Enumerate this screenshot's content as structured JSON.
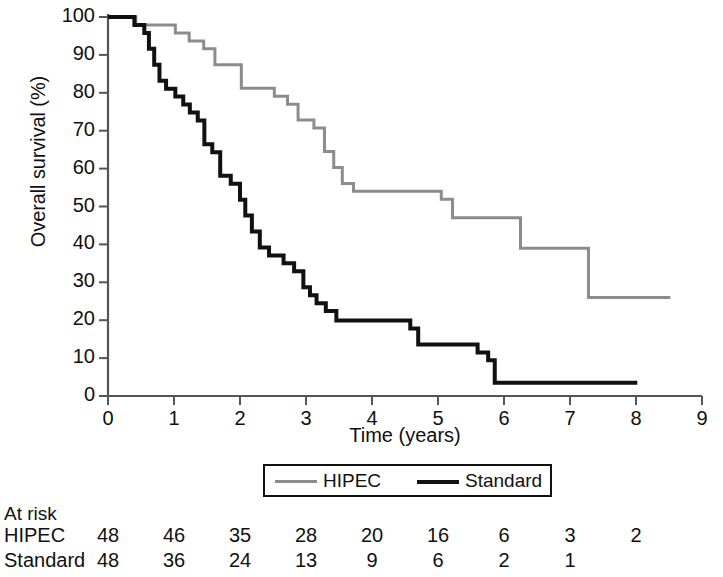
{
  "chart_data": {
    "type": "line",
    "title": "",
    "subtitle": "",
    "xlabel": "Time (years)",
    "ylabel": "Overall survival (%)",
    "xlim": [
      0,
      9
    ],
    "ylim": [
      0,
      100
    ],
    "xticks": [
      0,
      1,
      2,
      3,
      4,
      5,
      6,
      7,
      8,
      9
    ],
    "yticks": [
      0,
      10,
      20,
      30,
      40,
      50,
      60,
      70,
      80,
      90,
      100
    ],
    "grid": false,
    "legend_position": "bottom-center",
    "curve_style": "kaplan-meier step",
    "series": [
      {
        "name": "HIPEC",
        "color": "#8c8c8c",
        "linewidth": 3,
        "points": [
          [
            0.0,
            100
          ],
          [
            0.42,
            100
          ],
          [
            0.42,
            97.9
          ],
          [
            1.02,
            97.9
          ],
          [
            1.02,
            95.8
          ],
          [
            1.23,
            95.8
          ],
          [
            1.23,
            93.7
          ],
          [
            1.45,
            93.7
          ],
          [
            1.45,
            91.6
          ],
          [
            1.62,
            91.6
          ],
          [
            1.62,
            87.4
          ],
          [
            2.02,
            87.4
          ],
          [
            2.02,
            81.2
          ],
          [
            2.52,
            81.2
          ],
          [
            2.52,
            79.1
          ],
          [
            2.72,
            79.1
          ],
          [
            2.72,
            77.0
          ],
          [
            2.88,
            77.0
          ],
          [
            2.88,
            72.8
          ],
          [
            3.12,
            72.8
          ],
          [
            3.12,
            70.7
          ],
          [
            3.28,
            70.7
          ],
          [
            3.28,
            64.5
          ],
          [
            3.42,
            64.5
          ],
          [
            3.42,
            60.3
          ],
          [
            3.55,
            60.3
          ],
          [
            3.55,
            56.1
          ],
          [
            3.72,
            56.1
          ],
          [
            3.72,
            54.0
          ],
          [
            5.05,
            54.0
          ],
          [
            5.05,
            51.9
          ],
          [
            5.22,
            51.9
          ],
          [
            5.22,
            47.0
          ],
          [
            6.25,
            47.0
          ],
          [
            6.25,
            39.0
          ],
          [
            7.28,
            39.0
          ],
          [
            7.28,
            26.0
          ],
          [
            8.52,
            26.0
          ]
        ]
      },
      {
        "name": "Standard",
        "color": "#111111",
        "linewidth": 4,
        "points": [
          [
            0.0,
            100
          ],
          [
            0.4,
            100
          ],
          [
            0.4,
            97.9
          ],
          [
            0.55,
            97.9
          ],
          [
            0.55,
            95.8
          ],
          [
            0.62,
            95.8
          ],
          [
            0.62,
            91.6
          ],
          [
            0.7,
            91.6
          ],
          [
            0.7,
            87.4
          ],
          [
            0.78,
            87.4
          ],
          [
            0.78,
            83.2
          ],
          [
            0.88,
            83.2
          ],
          [
            0.88,
            81.1
          ],
          [
            1.02,
            81.1
          ],
          [
            1.02,
            79.0
          ],
          [
            1.14,
            79.0
          ],
          [
            1.14,
            76.9
          ],
          [
            1.24,
            76.9
          ],
          [
            1.24,
            74.8
          ],
          [
            1.36,
            74.8
          ],
          [
            1.36,
            72.7
          ],
          [
            1.46,
            72.7
          ],
          [
            1.46,
            66.4
          ],
          [
            1.58,
            66.4
          ],
          [
            1.58,
            64.3
          ],
          [
            1.7,
            64.3
          ],
          [
            1.7,
            58.1
          ],
          [
            1.86,
            58.1
          ],
          [
            1.86,
            56.0
          ],
          [
            2.0,
            56.0
          ],
          [
            2.0,
            51.8
          ],
          [
            2.08,
            51.8
          ],
          [
            2.08,
            47.6
          ],
          [
            2.18,
            47.6
          ],
          [
            2.18,
            43.4
          ],
          [
            2.3,
            43.4
          ],
          [
            2.3,
            39.2
          ],
          [
            2.44,
            39.2
          ],
          [
            2.44,
            37.1
          ],
          [
            2.66,
            37.1
          ],
          [
            2.66,
            35.0
          ],
          [
            2.82,
            35.0
          ],
          [
            2.82,
            32.9
          ],
          [
            2.96,
            32.9
          ],
          [
            2.96,
            28.7
          ],
          [
            3.06,
            28.7
          ],
          [
            3.06,
            26.6
          ],
          [
            3.16,
            26.6
          ],
          [
            3.16,
            24.5
          ],
          [
            3.3,
            24.5
          ],
          [
            3.3,
            22.4
          ],
          [
            3.46,
            22.4
          ],
          [
            3.46,
            19.9
          ],
          [
            4.58,
            19.9
          ],
          [
            4.58,
            17.8
          ],
          [
            4.7,
            17.8
          ],
          [
            4.7,
            13.6
          ],
          [
            5.6,
            13.6
          ],
          [
            5.6,
            11.5
          ],
          [
            5.76,
            11.5
          ],
          [
            5.76,
            9.4
          ],
          [
            5.86,
            9.4
          ],
          [
            5.86,
            3.5
          ],
          [
            8.02,
            3.5
          ]
        ]
      }
    ],
    "at_risk": {
      "title": "At risk",
      "times": [
        0,
        1,
        2,
        3,
        4,
        5,
        6,
        7,
        8
      ],
      "rows": [
        {
          "label": "HIPEC",
          "values": [
            "48",
            "46",
            "35",
            "28",
            "20",
            "16",
            "6",
            "3",
            "2"
          ]
        },
        {
          "label": "Standard",
          "values": [
            "48",
            "36",
            "24",
            "13",
            "9",
            "6",
            "2",
            "1",
            ""
          ]
        }
      ]
    },
    "legend": [
      {
        "label": "HIPEC",
        "color": "#8c8c8c"
      },
      {
        "label": "Standard",
        "color": "#111111"
      }
    ]
  },
  "axes": {
    "y_title": "Overall survival (%)",
    "x_title": "Time (years)",
    "y_tick_labels": [
      "100",
      "90",
      "80",
      "70",
      "60",
      "50",
      "40",
      "30",
      "20",
      "10",
      "0"
    ],
    "x_tick_labels": [
      "0",
      "1",
      "2",
      "3",
      "4",
      "5",
      "6",
      "7",
      "8",
      "9"
    ]
  },
  "legend": {
    "hipec_label": "HIPEC",
    "standard_label": "Standard"
  },
  "at_risk": {
    "title": "At risk",
    "hipec_label": "HIPEC",
    "standard_label": "Standard",
    "hipec": [
      "48",
      "46",
      "35",
      "28",
      "20",
      "16",
      "6",
      "3",
      "2"
    ],
    "standard": [
      "48",
      "36",
      "24",
      "13",
      "9",
      "6",
      "2",
      "1",
      ""
    ]
  },
  "colors": {
    "hipec": "#8c8c8c",
    "standard": "#111111",
    "axis": "#555555",
    "text": "#101010"
  }
}
